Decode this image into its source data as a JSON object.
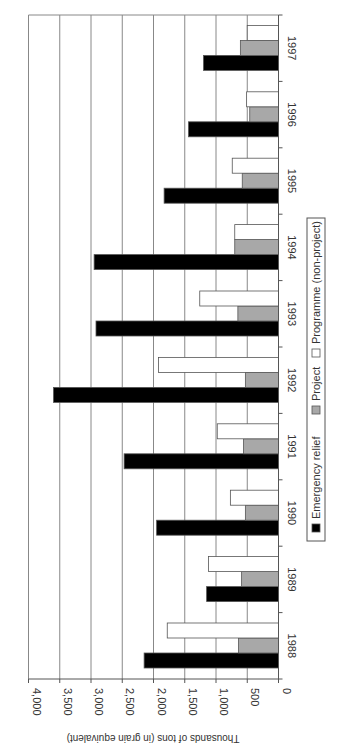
{
  "chart_data": {
    "type": "bar",
    "orientation": "rotated-90-clockwise-grouped-bar",
    "title": "",
    "xlabel": "",
    "ylabel": "Thousands of tons (in grain equivalent)",
    "ylim": [
      0,
      4000
    ],
    "yticks": [
      0,
      500,
      1000,
      1500,
      2000,
      2500,
      3000,
      3500,
      4000
    ],
    "ytick_labels": [
      "0",
      "500",
      "1,000",
      "1,500",
      "2,000",
      "2,500",
      "3,000",
      "3,500",
      "4,000"
    ],
    "grid": true,
    "legend_position": "right-side (rotated, bottom-center of unrotated chart)",
    "categories": [
      "1988",
      "1989",
      "1990",
      "1991",
      "1992",
      "1993",
      "1994",
      "1995",
      "1996",
      "1997"
    ],
    "series": [
      {
        "name": "Emergency relief",
        "color": "#000000",
        "values": [
          2150,
          1150,
          1950,
          2470,
          3600,
          2920,
          2950,
          1830,
          1440,
          1200
        ]
      },
      {
        "name": "Project",
        "color": "#a8a8a8",
        "values": [
          640,
          590,
          530,
          560,
          530,
          650,
          700,
          580,
          460,
          610
        ]
      },
      {
        "name": "Programme (non-project)",
        "color": "#ffffff",
        "values": [
          1780,
          1120,
          770,
          980,
          1920,
          1260,
          700,
          740,
          510,
          500
        ]
      }
    ]
  },
  "legend": {
    "items": [
      {
        "label": "Emergency relief",
        "swatch": "#000000"
      },
      {
        "label": "Project",
        "swatch": "#a8a8a8"
      },
      {
        "label": "Programme (non-project)",
        "swatch": "#ffffff"
      }
    ]
  },
  "colors": {
    "gridline": "#888888",
    "axis": "#555555",
    "bar_outline": "#555555"
  }
}
